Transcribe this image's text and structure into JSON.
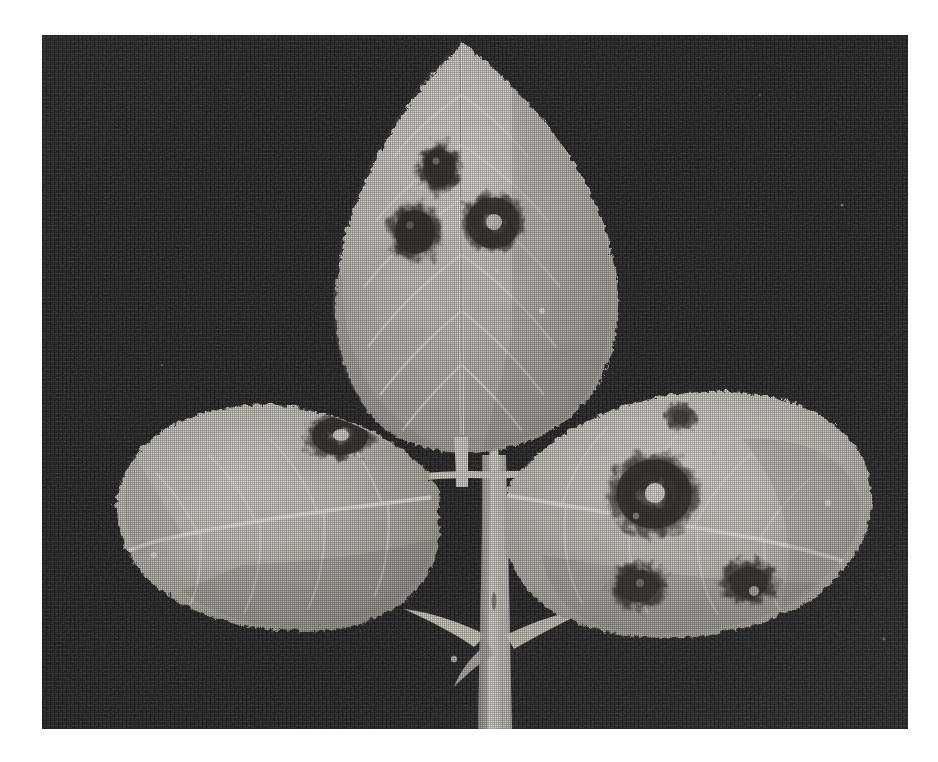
{
  "page": {
    "width": 938,
    "height": 762,
    "background_color": "#ffffff",
    "kind": "scanned-photograph",
    "caption": ""
  },
  "photo": {
    "x": 42,
    "y": 35,
    "width": 866,
    "height": 694,
    "colors": {
      "background_dark": "#1f1f1f",
      "background_dark_2": "#2a2a2a",
      "leaf_light": "#dedad2",
      "leaf_mid": "#c2beb6",
      "leaf_shadow": "#9d9a94",
      "vein_light": "#efece6",
      "lesion_dark": "#3a3734",
      "lesion_mid": "#5e5a55",
      "lesion_center": "#e8e5de",
      "stem_light": "#ded9d1",
      "stem_shadow": "#a29e97"
    },
    "subject": {
      "name": "rose-trifoliate-leaf",
      "description": "Black-and-white photograph of a trifoliate rose leaf on a dark background showing black spot lesions",
      "leaflet_count": 3,
      "lesion_count": 8
    },
    "leaflets": [
      {
        "name": "terminal-leaflet",
        "position": "top-center",
        "lesions": 3
      },
      {
        "name": "left-lateral-leaflet",
        "position": "left",
        "lesions": 1
      },
      {
        "name": "right-lateral-leaflet",
        "position": "right",
        "lesions": 4
      }
    ],
    "lesions": [
      {
        "id": "t1",
        "leaflet": "terminal-leaflet",
        "cx": 397,
        "cy": 133,
        "rx": 26,
        "ry": 30,
        "center_light": false
      },
      {
        "id": "t2",
        "leaflet": "terminal-leaflet",
        "cx": 373,
        "cy": 197,
        "rx": 30,
        "ry": 32,
        "center_light": false
      },
      {
        "id": "t3",
        "leaflet": "terminal-leaflet",
        "cx": 451,
        "cy": 188,
        "rx": 34,
        "ry": 33,
        "center_light": true
      },
      {
        "id": "l1",
        "leaflet": "left-lateral-leaflet",
        "cx": 298,
        "cy": 401,
        "rx": 36,
        "ry": 25,
        "center_light": true
      },
      {
        "id": "r1",
        "leaflet": "right-lateral-leaflet",
        "cx": 612,
        "cy": 459,
        "rx": 47,
        "ry": 44,
        "center_light": true
      },
      {
        "id": "r2",
        "leaflet": "right-lateral-leaflet",
        "cx": 639,
        "cy": 382,
        "rx": 17,
        "ry": 15,
        "center_light": false
      },
      {
        "id": "r3",
        "leaflet": "right-lateral-leaflet",
        "cx": 596,
        "cy": 551,
        "rx": 32,
        "ry": 26,
        "center_light": false
      },
      {
        "id": "r4",
        "leaflet": "right-lateral-leaflet",
        "cx": 707,
        "cy": 547,
        "rx": 31,
        "ry": 25,
        "center_light": true
      }
    ],
    "stem": {
      "name": "petiole-with-stipules",
      "top_x": 452,
      "bottom_y": 694
    }
  }
}
